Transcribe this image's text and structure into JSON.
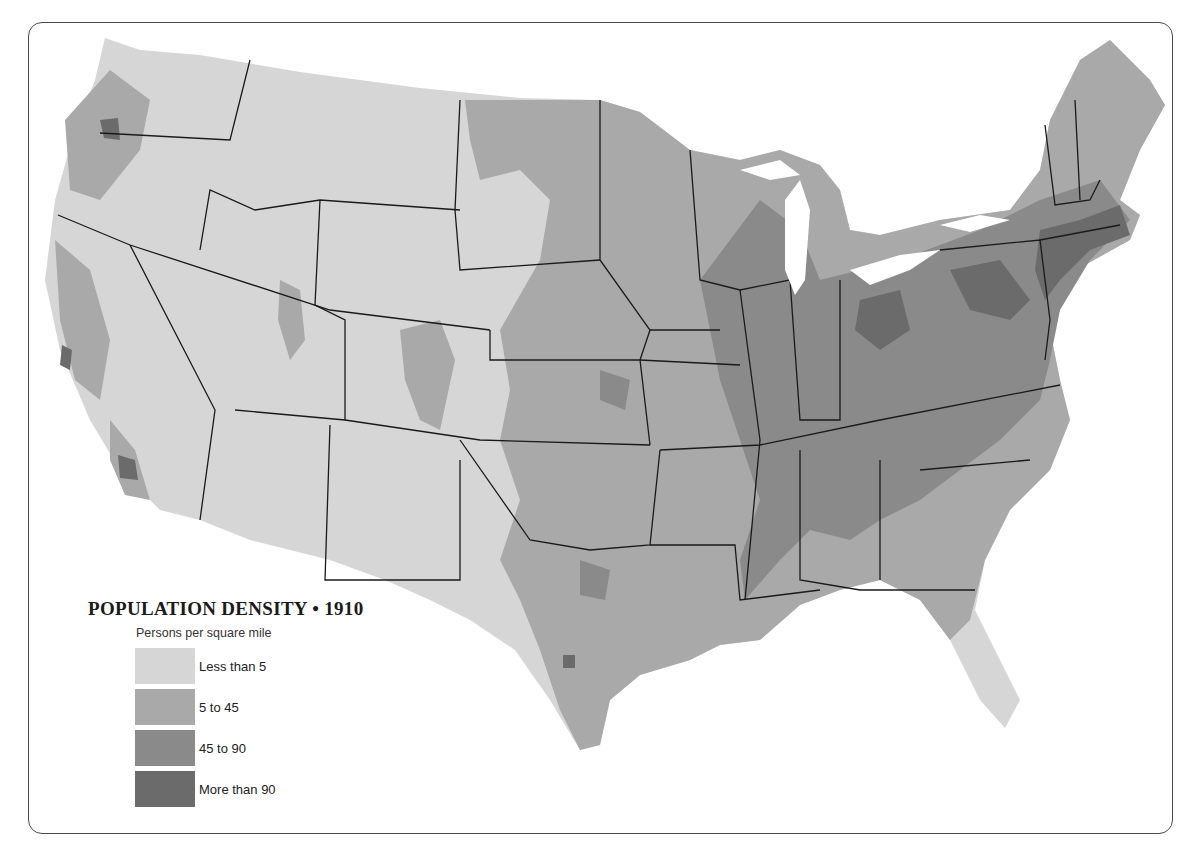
{
  "title": "POPULATION DENSITY • 1910",
  "subtitle": "Persons per square mile",
  "legend": [
    {
      "label": "Less than 5",
      "color": "#d6d6d6"
    },
    {
      "label": "5 to 45",
      "color": "#a9a9a9"
    },
    {
      "label": "45 to 90",
      "color": "#8a8a8a"
    },
    {
      "label": "More than 90",
      "color": "#6b6b6b"
    }
  ],
  "map": {
    "region": "Contiguous United States",
    "year": "1910",
    "border_color": "#1a1a1a",
    "pattern": "Density highest in the Northeast, Great Lakes and Ohio Valley; moderate across the Midwest and South; sparse across the Great Plains, Rockies and Southwest, with localized clusters around Puget Sound, Willamette Valley, San Francisco Bay, Los Angeles, Salt Lake, Denver and Central Texas"
  }
}
